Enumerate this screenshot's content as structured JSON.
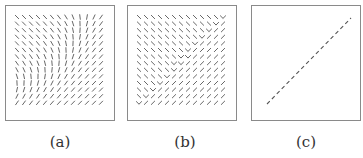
{
  "figure": {
    "panels": [
      {
        "id": "a",
        "label": "(a)",
        "description": "smoothly rotating orientation field of short strokes",
        "grid": {
          "cols": 13,
          "rows": 14
        }
      },
      {
        "id": "b",
        "label": "(b)",
        "description": "orientation field with sharp discontinuity along anti-diagonal (V-shaped junctions)",
        "grid": {
          "cols": 13,
          "rows": 14
        }
      },
      {
        "id": "c",
        "label": "(c)",
        "description": "dashed diagonal line marking the discontinuity"
      }
    ],
    "colors": {
      "stroke": "#555555",
      "border": "#8a8a8a",
      "label": "#333333"
    }
  }
}
